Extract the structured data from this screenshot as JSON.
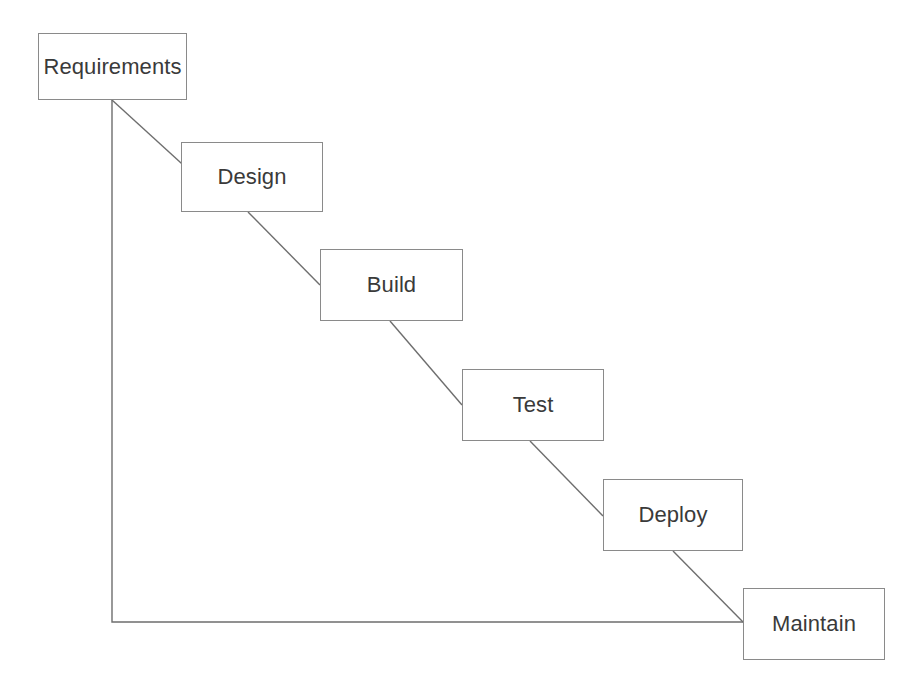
{
  "diagram": {
    "type": "flowchart",
    "background_color": "#ffffff",
    "box_border_color": "#8a8a8a",
    "connector_color": "#6e6e6e",
    "text_color": "#3a3a3a",
    "canvas": {
      "width": 923,
      "height": 695
    },
    "phases": [
      {
        "id": "requirements",
        "label": "Requirements",
        "x": 38,
        "y": 33,
        "width": 149,
        "height": 67
      },
      {
        "id": "design",
        "label": "Design",
        "x": 181,
        "y": 142,
        "width": 142,
        "height": 70
      },
      {
        "id": "build",
        "label": "Build",
        "x": 320,
        "y": 249,
        "width": 143,
        "height": 72
      },
      {
        "id": "test",
        "label": "Test",
        "x": 462,
        "y": 369,
        "width": 142,
        "height": 72
      },
      {
        "id": "deploy",
        "label": "Deploy",
        "x": 603,
        "y": 479,
        "width": 140,
        "height": 72
      },
      {
        "id": "maintain",
        "label": "Maintain",
        "x": 743,
        "y": 588,
        "width": 142,
        "height": 72
      }
    ],
    "connectors": [
      {
        "id": "requirements-to-design",
        "from": "requirements",
        "to": "design",
        "kind": "diagonal",
        "points": "112,100 192,173"
      },
      {
        "id": "design-to-build",
        "from": "design",
        "to": "build",
        "kind": "diagonal",
        "points": "248,212 320,285"
      },
      {
        "id": "build-to-test",
        "from": "build",
        "to": "test",
        "kind": "diagonal",
        "points": "390,321 462,405"
      },
      {
        "id": "test-to-deploy",
        "from": "test",
        "to": "deploy",
        "kind": "diagonal",
        "points": "530,441 603,516"
      },
      {
        "id": "deploy-to-maintain",
        "from": "deploy",
        "to": "maintain",
        "kind": "diagonal",
        "points": "673,551 743,622"
      },
      {
        "id": "requirements-to-maintain-feedback",
        "from": "requirements",
        "to": "maintain",
        "kind": "elbow",
        "points": "112,100 112,622 743,622"
      }
    ]
  }
}
